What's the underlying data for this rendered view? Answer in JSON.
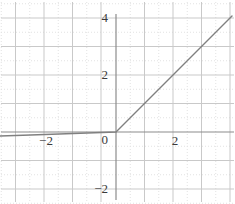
{
  "chart_data": {
    "type": "line",
    "title": "",
    "subtitle": "",
    "xlabel": "",
    "ylabel": "",
    "xlim": [
      -4.07,
      4.17
    ],
    "ylim": [
      -2.21,
      4.14
    ],
    "grid": true,
    "grid_major_step": 1,
    "grid_minor_step": 0.5,
    "legend": false,
    "legend_position": "none",
    "axis_lines": [
      "x-axis at y=0",
      "y-axis at x=0"
    ],
    "x_tick_labels": [
      "-2",
      "2"
    ],
    "x_tick_values": [
      -2,
      2
    ],
    "y_tick_labels": [
      "4",
      "2",
      "0",
      "-2"
    ],
    "y_tick_values": [
      4,
      2,
      0,
      -2
    ],
    "origin_label": "0",
    "series": [
      {
        "name": "f(x)",
        "color": "#808080",
        "x": [
          -4.07,
          -3,
          -2,
          -1,
          0,
          1,
          2,
          3,
          4.07
        ],
        "values": [
          -0.1424,
          -0.105,
          -0.07,
          -0.035,
          0,
          1,
          2,
          3,
          4.07
        ]
      }
    ],
    "breakpoints": [
      {
        "x": 0,
        "y": 0,
        "label": "origin"
      }
    ],
    "slopes": {
      "negative_branch": 0.035,
      "positive_branch": 1
    }
  },
  "style": {
    "background": "#ffffff",
    "axis_color": "#8c8c8c",
    "grid_major_color": "#c9c9c9",
    "grid_minor_color": "#e2e2e2",
    "curve_color": "#7d7d7d",
    "label_color": "#3a3a3a"
  },
  "labels": {
    "y4": "4",
    "y2": "2",
    "y0": "0",
    "ym2": "−2",
    "x2": "2",
    "xm2": "−2"
  }
}
